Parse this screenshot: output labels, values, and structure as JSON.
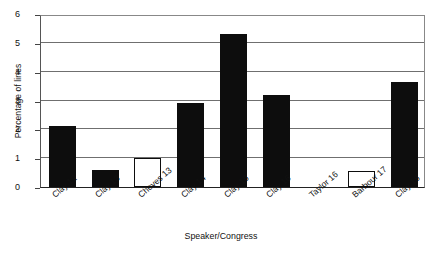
{
  "chart_data": {
    "type": "bar",
    "title": "",
    "xlabel": "Speaker/Congress",
    "ylabel": "Percentage of lines",
    "categories": [
      "Clay 12",
      "Clay 13",
      "Cheves 13",
      "Clay 14",
      "Clay 15",
      "Clay 16",
      "Taylor 16",
      "Barbour 17",
      "Clay 18"
    ],
    "values": [
      2.12,
      0.6,
      1.0,
      2.9,
      5.3,
      3.18,
      0.0,
      0.55,
      3.65
    ],
    "bar_styles": [
      "filled",
      "filled",
      "hollow",
      "filled",
      "filled",
      "filled",
      "filled",
      "hollow",
      "filled"
    ],
    "ylim": [
      0,
      6
    ],
    "yticks": [
      0,
      1,
      2,
      3,
      4,
      5,
      6
    ],
    "ytick_labels": [
      "0",
      "1",
      "2",
      "3",
      "4",
      "5",
      "6"
    ],
    "grid": true,
    "legend": null,
    "colors": {
      "filled_bar": "#0d0d0d",
      "hollow_bar_fill": "#ffffff",
      "hollow_bar_border": "#0d0d0d",
      "gridline": "#6f6f6f",
      "axis": "#222222",
      "background": "#ffffff",
      "text": "#111111"
    }
  }
}
